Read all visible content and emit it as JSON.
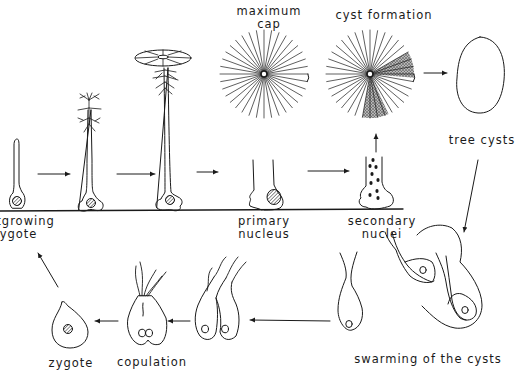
{
  "figure": {
    "type": "life-cycle diagram",
    "colors": {
      "ink": "#1a1a1a",
      "background": "#ffffff"
    }
  },
  "labels": {
    "maximum_cap_line1": "maximum",
    "maximum_cap_line2": "cap",
    "cyst_formation": "cyst formation",
    "free_cysts": "tree cysts",
    "outgrowing_line1": "outgrowing",
    "outgrowing_line2": "zygote",
    "primary_line1": "primary",
    "primary_line2": "nucleus",
    "secondary_line1": "secondary",
    "secondary_line2": "nuclei",
    "swarming": "swarming of the cysts",
    "copulation": "copulation",
    "zygote": "zygote"
  },
  "stages": [
    "outgrowing zygote",
    "stalk with whorls",
    "young cap",
    "maximum cap",
    "primary nucleus",
    "secondary nuclei",
    "cyst formation",
    "free cysts",
    "swarming of the cysts",
    "gametes",
    "copulation",
    "zygote"
  ]
}
